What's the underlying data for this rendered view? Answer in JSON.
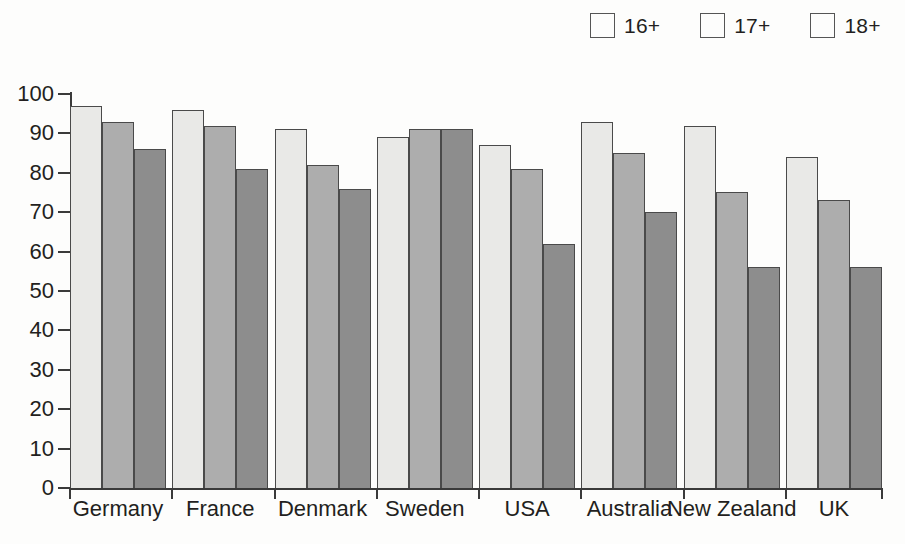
{
  "chart_data": {
    "type": "bar",
    "title": "",
    "subtitle": "",
    "xlabel": "",
    "ylabel": "",
    "ylim": [
      0,
      100
    ],
    "yticks": [
      0,
      10,
      20,
      30,
      40,
      50,
      60,
      70,
      80,
      90,
      100
    ],
    "grid": false,
    "legend_position": "top-right",
    "categories": [
      "Germany",
      "France",
      "Denmark",
      "Sweden",
      "USA",
      "Australia",
      "New Zealand",
      "UK"
    ],
    "series": [
      {
        "name": "16+",
        "color": "#e9e9e7",
        "values": [
          97,
          96,
          91,
          89,
          87,
          93,
          92,
          84
        ]
      },
      {
        "name": "17+",
        "color": "#adadad",
        "values": [
          93,
          92,
          82,
          91,
          81,
          85,
          75,
          73
        ]
      },
      {
        "name": "18+",
        "color": "#8d8d8d",
        "values": [
          86,
          81,
          76,
          91,
          62,
          70,
          56,
          56
        ]
      }
    ]
  },
  "legend": {
    "items": [
      {
        "label": "16+",
        "swatch": "legend-swatch-16plus"
      },
      {
        "label": "17+",
        "swatch": "legend-swatch-17plus"
      },
      {
        "label": "18+",
        "swatch": "legend-swatch-18plus"
      }
    ]
  },
  "axes": {
    "y_tick_labels": [
      "100",
      "90",
      "80",
      "70",
      "60",
      "50",
      "40",
      "30",
      "20",
      "10",
      "0"
    ],
    "x_tick_labels": [
      "Germany",
      "France",
      "Denmark",
      "Sweden",
      "USA",
      "Australia",
      "New Zealand",
      "UK"
    ]
  },
  "colors": {
    "series_16plus": "#e9e9e7",
    "series_17plus": "#adadad",
    "series_18plus": "#8d8d8d",
    "axis": "#3a3a3a",
    "text": "#231f20",
    "background": "#fdfdfc"
  }
}
